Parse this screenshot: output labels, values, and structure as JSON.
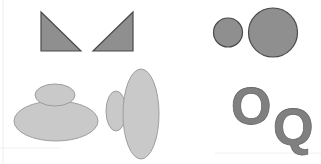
{
  "canvas": {
    "width": 321,
    "height": 164,
    "background": "#ffffff"
  },
  "colors": {
    "dark_fill": "#8f8f8f",
    "dark_stroke": "#4a4a4a",
    "light_fill": "#c9c9c9",
    "light_stroke": "#9e9e9e",
    "letter_fill": "#808080",
    "letter_stroke": "#6a6a6a"
  },
  "groups": [
    {
      "name": "triangle-pair",
      "shapes": [
        "right-triangle-left",
        "right-triangle-right"
      ]
    },
    {
      "name": "circle-pair",
      "shapes": [
        "small-circle",
        "large-circle"
      ]
    },
    {
      "name": "stacked-ellipses",
      "shapes": [
        "top-small-ellipse",
        "bottom-wide-ellipse"
      ]
    },
    {
      "name": "side-ellipses",
      "shapes": [
        "left-small-ellipse",
        "right-tall-ellipse"
      ]
    },
    {
      "name": "letter-pair",
      "letters": [
        "O",
        "Q"
      ]
    }
  ],
  "letters": {
    "first": "O",
    "second": "Q"
  }
}
